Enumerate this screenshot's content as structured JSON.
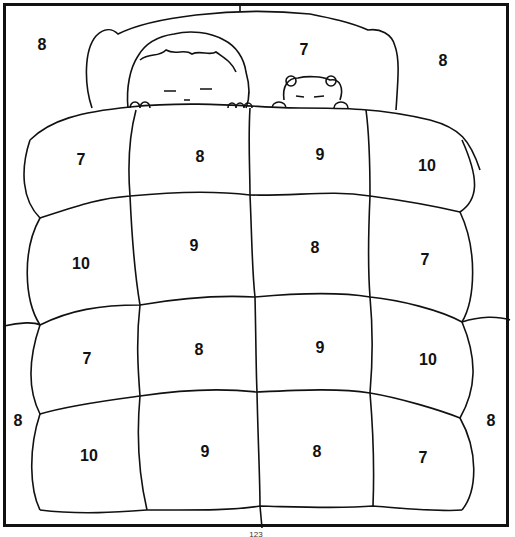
{
  "worksheet": {
    "type": "color-by-number coloring page",
    "scene": "child and teddy bear sleeping under a quilted blanket",
    "outline_color": "#111111",
    "background_color": "#ffffff",
    "regions": [
      {
        "id": "bg-top-left",
        "label": "8",
        "x": 42,
        "y": 45
      },
      {
        "id": "pillow",
        "label": "7",
        "x": 304,
        "y": 50
      },
      {
        "id": "bg-top-right",
        "label": "8",
        "x": 443,
        "y": 61
      },
      {
        "id": "r1c1",
        "label": "7",
        "x": 81,
        "y": 160
      },
      {
        "id": "r1c2",
        "label": "8",
        "x": 200,
        "y": 157
      },
      {
        "id": "r1c3",
        "label": "9",
        "x": 320,
        "y": 155
      },
      {
        "id": "r1c4",
        "label": "10",
        "x": 427,
        "y": 166
      },
      {
        "id": "r2c1",
        "label": "10",
        "x": 81,
        "y": 264
      },
      {
        "id": "r2c2",
        "label": "9",
        "x": 194,
        "y": 246
      },
      {
        "id": "r2c3",
        "label": "8",
        "x": 315,
        "y": 248
      },
      {
        "id": "r2c4",
        "label": "7",
        "x": 425,
        "y": 260
      },
      {
        "id": "r3c1",
        "label": "7",
        "x": 87,
        "y": 359
      },
      {
        "id": "r3c2",
        "label": "8",
        "x": 199,
        "y": 350
      },
      {
        "id": "r3c3",
        "label": "9",
        "x": 320,
        "y": 348
      },
      {
        "id": "r3c4",
        "label": "10",
        "x": 428,
        "y": 360
      },
      {
        "id": "bg-bottom-left",
        "label": "8",
        "x": 18,
        "y": 421
      },
      {
        "id": "bg-bottom-right",
        "label": "8",
        "x": 491,
        "y": 421
      },
      {
        "id": "r4c1",
        "label": "10",
        "x": 89,
        "y": 456
      },
      {
        "id": "r4c2",
        "label": "9",
        "x": 205,
        "y": 452
      },
      {
        "id": "r4c3",
        "label": "8",
        "x": 317,
        "y": 452
      },
      {
        "id": "r4c4",
        "label": "7",
        "x": 423,
        "y": 458
      }
    ],
    "page_number": "123"
  }
}
